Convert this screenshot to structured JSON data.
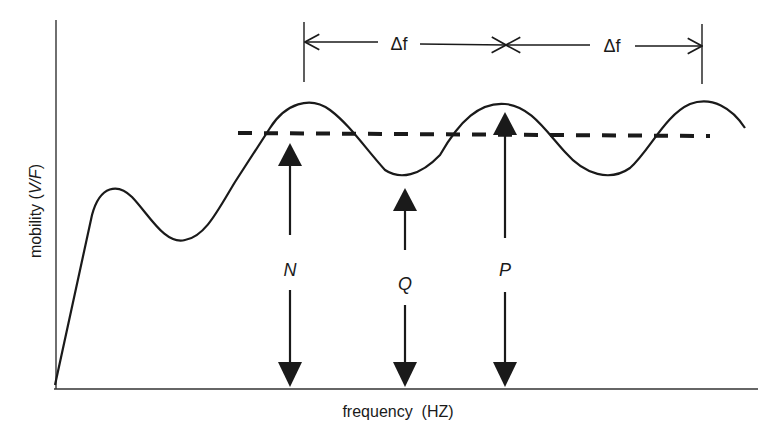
{
  "figure": {
    "type": "diagram",
    "y_axis_label": "mobility (V/F)",
    "y_axis_label_parts": [
      "mobility (",
      "V/F",
      ")"
    ],
    "x_axis_label": "frequency  (HZ)",
    "delta_labels": [
      "Δf",
      "Δf"
    ],
    "markers": [
      {
        "id": "N",
        "label": "N",
        "x": 290,
        "meaning": "mean level arrow"
      },
      {
        "id": "Q",
        "label": "Q",
        "x": 405,
        "meaning": "trough arrow"
      },
      {
        "id": "P",
        "label": "P",
        "x": 505,
        "meaning": "peak arrow"
      }
    ],
    "colors": {
      "ink": "#1a1a1a",
      "background": "#ffffff"
    }
  }
}
